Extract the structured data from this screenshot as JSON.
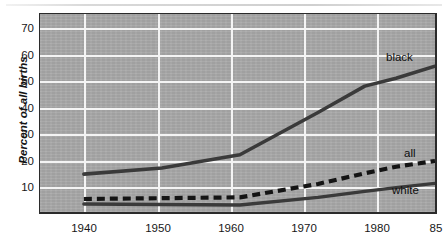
{
  "chart_data": {
    "type": "line",
    "title": "",
    "xlabel": "",
    "ylabel": "Percent of all births",
    "xlim": [
      1940,
      1985
    ],
    "ylim": [
      0,
      75
    ],
    "yticks": [
      10,
      20,
      30,
      40,
      50,
      60,
      70
    ],
    "xticks": [
      1940,
      1950,
      1960,
      1970,
      1980,
      1985
    ],
    "xtick_labels": [
      "1940",
      "1950",
      "1960",
      "1970",
      "1980",
      "85"
    ],
    "grid": "white gridlines on gray panel, both axes",
    "legend": "inline labels at right end of each series",
    "x": [
      1940,
      1950,
      1960,
      1970,
      1976,
      1980,
      1985
    ],
    "series": [
      {
        "name": "black",
        "label": "black",
        "style": "solid",
        "color": "#3a3a3a",
        "values": [
          14.7,
          17.0,
          22.0,
          38.0,
          48.0,
          51.0,
          55.5
        ]
      },
      {
        "name": "all",
        "label": "all",
        "style": "dashed",
        "color": "#141414",
        "values": [
          5.3,
          5.6,
          5.9,
          11.0,
          15.0,
          17.5,
          19.7
        ]
      },
      {
        "name": "white",
        "label": "white",
        "style": "solid",
        "color": "#3a3a3a",
        "values": [
          3.4,
          3.2,
          3.0,
          5.9,
          8.2,
          9.6,
          11.2
        ]
      }
    ],
    "panel_color": "#a8a8a8",
    "gridline_color": "#f4f4f4",
    "axis_color": "#2b2b2b"
  }
}
